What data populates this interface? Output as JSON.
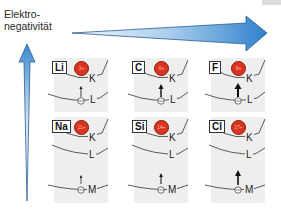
{
  "axis_label": {
    "line1": "Elektro-",
    "line2": "negativität"
  },
  "colors": {
    "arrow_light": "#e6f1fa",
    "arrow_dark": "#3a8ad0",
    "nucleus": "#d9341f",
    "panel": "#eeeeee"
  },
  "panels": [
    {
      "symbol": "Li",
      "charge": "3+",
      "shells": [
        "K",
        "L"
      ]
    },
    {
      "symbol": "C",
      "charge": "6+",
      "shells": [
        "K",
        "L"
      ]
    },
    {
      "symbol": "F",
      "charge": "9+",
      "shells": [
        "K",
        "L"
      ]
    },
    {
      "symbol": "Na",
      "charge": "11+",
      "shells": [
        "K",
        "L",
        "M"
      ]
    },
    {
      "symbol": "Si",
      "charge": "14+",
      "shells": [
        "K",
        "L",
        "M"
      ]
    },
    {
      "symbol": "Cl",
      "charge": "17+",
      "shells": [
        "K",
        "L",
        "M"
      ]
    }
  ]
}
